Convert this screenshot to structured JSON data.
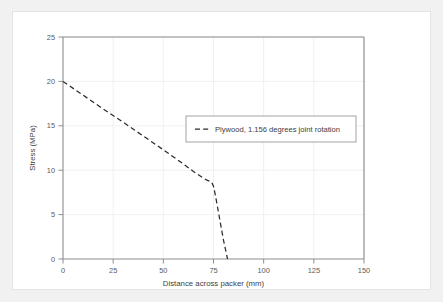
{
  "chart_data": {
    "type": "line",
    "title": "",
    "xlabel": "Distance across packer (mm)",
    "ylabel": "Stress (MPa)",
    "xlim": [
      0,
      150
    ],
    "ylim": [
      0,
      25
    ],
    "xticks": [
      0,
      25,
      50,
      75,
      100,
      125,
      150
    ],
    "yticks": [
      0,
      5,
      10,
      15,
      20,
      25
    ],
    "grid": true,
    "legend_position": "center-right",
    "series": [
      {
        "name": "Plywood, 1.156 degrees joint rotation",
        "style": "dashed",
        "color": "#2b2b2b",
        "x": [
          0,
          10,
          20,
          30,
          40,
          50,
          60,
          65,
          70,
          72,
          74,
          75,
          76,
          78,
          80,
          82
        ],
        "y": [
          20.0,
          18.45,
          16.9,
          15.4,
          13.85,
          12.3,
          10.7,
          9.85,
          9.1,
          8.85,
          8.7,
          8.2,
          7.1,
          4.6,
          2.1,
          0.0
        ]
      }
    ]
  },
  "axes": {
    "x_tick_labels": [
      "0",
      "25",
      "50",
      "75",
      "100",
      "125",
      "150"
    ],
    "y_tick_labels": [
      "0",
      "5",
      "10",
      "15",
      "20",
      "25"
    ],
    "x_axis_title": "Distance across packer (mm)",
    "y_axis_title": "Stress (MPa)"
  },
  "legend": {
    "entries": [
      {
        "label": "Plywood, 1.156 degrees joint rotation",
        "marker": "dashed-line"
      }
    ]
  },
  "colors": {
    "series_line": "#2b2b2b",
    "frame": "#808080",
    "grid": "#e6e6e6",
    "tick_text": "#5a5a5a",
    "panel_background": "#ffffff",
    "page_background": "#f1f1f1"
  }
}
